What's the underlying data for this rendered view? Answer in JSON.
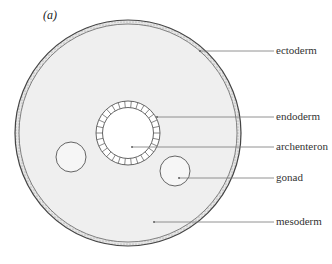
{
  "figure": {
    "panel_label": "(a)",
    "labels": {
      "ectoderm": "ectoderm",
      "endoderm": "endoderm",
      "archenteron": "archenteron",
      "gonad": "gonad",
      "mesoderm": "mesoderm"
    },
    "colors": {
      "background": "#ffffff",
      "mesoderm_fill": "#efefef",
      "ectoderm_band": "#dcdcdc",
      "outline": "#555555",
      "leader_line": "#777777"
    }
  }
}
